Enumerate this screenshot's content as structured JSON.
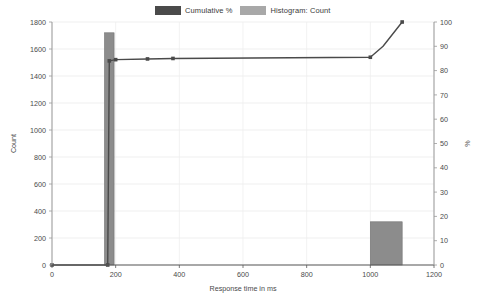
{
  "chart_data": {
    "type": "bar",
    "title": "",
    "xlabel": "Response time in ms",
    "ylabel": "Count",
    "y2label": "%",
    "xlim": [
      0,
      1200
    ],
    "ylim": [
      0,
      1800
    ],
    "y2lim": [
      0,
      100
    ],
    "xticks": [
      0,
      200,
      400,
      600,
      800,
      1000,
      1200
    ],
    "yticks": [
      0,
      200,
      400,
      600,
      800,
      1000,
      1200,
      1400,
      1600,
      1800
    ],
    "y2ticks": [
      0,
      10,
      20,
      30,
      40,
      50,
      60,
      70,
      80,
      90,
      100
    ],
    "grid": true,
    "legend_position": "top-center",
    "series": [
      {
        "name": "Histogram: Count",
        "type": "bar",
        "axis": "left",
        "color": "#8c8c8c",
        "bars": [
          {
            "x_start": 165,
            "x_end": 195,
            "value": 1720
          },
          {
            "x_start": 1000,
            "x_end": 1100,
            "value": 320
          }
        ]
      },
      {
        "name": "Cumulative %",
        "type": "line",
        "axis": "right",
        "color": "#4a4a4a",
        "points": [
          {
            "x": 0,
            "y": 0
          },
          {
            "x": 150,
            "y": 0
          },
          {
            "x": 175,
            "y": 0
          },
          {
            "x": 180,
            "y": 84
          },
          {
            "x": 200,
            "y": 84.5
          },
          {
            "x": 300,
            "y": 84.8
          },
          {
            "x": 380,
            "y": 85.0
          },
          {
            "x": 1000,
            "y": 85.5
          },
          {
            "x": 1040,
            "y": 90
          },
          {
            "x": 1100,
            "y": 100
          }
        ],
        "markers": [
          {
            "x": 0,
            "y": 0
          },
          {
            "x": 175,
            "y": 0
          },
          {
            "x": 180,
            "y": 84
          },
          {
            "x": 200,
            "y": 84.5
          },
          {
            "x": 300,
            "y": 84.8
          },
          {
            "x": 380,
            "y": 85.0
          },
          {
            "x": 1000,
            "y": 85.5
          },
          {
            "x": 1100,
            "y": 100
          }
        ]
      }
    ]
  },
  "legend": {
    "items": [
      {
        "label": "Cumulative %",
        "color": "#4a4a4a"
      },
      {
        "label": "Histogram: Count",
        "color": "#a8a8a8"
      }
    ]
  },
  "axes": {
    "x_title": "Response time in ms",
    "y_title": "Count",
    "y2_title": "%"
  }
}
